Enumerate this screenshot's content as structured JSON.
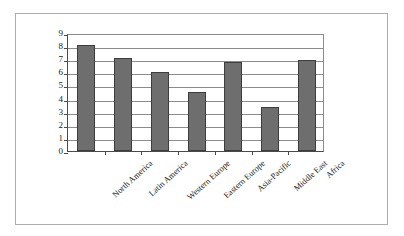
{
  "chart_data": {
    "type": "bar",
    "title": "",
    "subtitle": "",
    "xlabel": "",
    "ylabel": "",
    "categories": [
      "North America",
      "Latin America",
      "Western Europe",
      "Eastern Europe",
      "Asia-Pacific",
      "Middle East",
      "Africa"
    ],
    "values": [
      8.1,
      7.1,
      6.0,
      4.5,
      6.8,
      3.35,
      6.95
    ],
    "ylim": [
      0,
      9
    ],
    "yticks": [
      "0",
      "1",
      "2",
      "3",
      "4",
      "5",
      "6",
      "7",
      "8",
      "9"
    ],
    "ytick_values": [
      0,
      1,
      2,
      3,
      4,
      5,
      6,
      7,
      8,
      9
    ],
    "grid": true,
    "grid_axis": "y",
    "legend": false,
    "legend_position": "none",
    "bar_color": "#6e6e6e",
    "bar_edge_color": "#3d3d3d",
    "axis_color": "#4a4a4a",
    "grid_color": "#8c8c8c",
    "frame_color": "#adadad",
    "background_color": "#ffffff",
    "series": [
      {
        "name": "",
        "values": [
          8.1,
          7.1,
          6.0,
          4.5,
          6.8,
          3.35,
          6.95
        ]
      }
    ]
  }
}
